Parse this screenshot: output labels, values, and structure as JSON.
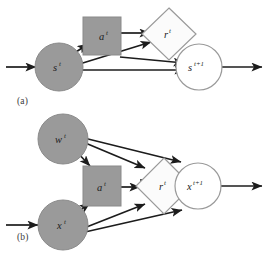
{
  "figure": {
    "background": "#ffffff",
    "colors": {
      "node_fill_gray": "#9a9a9a",
      "node_stroke_gray": "#8a8a8a",
      "node_fill_white": "#ffffff",
      "node_stroke_white": "#9a9a9a",
      "diamond_fill": "#fbfbfb",
      "diamond_stroke": "#9a9a9a",
      "arrow": "#1c1c1c",
      "label_text": "#1c1c1c",
      "panel_label_text": "#3a3a3a"
    }
  },
  "panel_a": {
    "label": "(a)",
    "nodes": [
      {
        "id": "s_t",
        "base": "s",
        "sup": "t",
        "shape": "circle",
        "fill": "gray",
        "role": "state-current"
      },
      {
        "id": "a_t",
        "base": "a",
        "sup": "t",
        "shape": "square",
        "fill": "gray",
        "role": "action"
      },
      {
        "id": "r_t",
        "base": "r",
        "sup": "t",
        "shape": "diamond",
        "fill": "white",
        "role": "reward"
      },
      {
        "id": "s_t1",
        "base": "s",
        "sup": "t+1",
        "shape": "circle",
        "fill": "white",
        "role": "state-next"
      }
    ],
    "edges": [
      {
        "from": "input",
        "to": "s_t"
      },
      {
        "from": "s_t",
        "to": "a_t"
      },
      {
        "from": "s_t",
        "to": "r_t"
      },
      {
        "from": "s_t",
        "to": "s_t1"
      },
      {
        "from": "a_t",
        "to": "r_t"
      },
      {
        "from": "a_t",
        "to": "s_t1"
      },
      {
        "from": "s_t1",
        "to": "output"
      }
    ]
  },
  "panel_b": {
    "label": "(b)",
    "nodes": [
      {
        "id": "w_t",
        "base": "w",
        "sup": "t",
        "shape": "circle",
        "fill": "gray",
        "role": "weights"
      },
      {
        "id": "x_t",
        "base": "x",
        "sup": "t",
        "shape": "circle",
        "fill": "gray",
        "role": "observation-current"
      },
      {
        "id": "a_t",
        "base": "a",
        "sup": "t",
        "shape": "square",
        "fill": "gray",
        "role": "action"
      },
      {
        "id": "r_t",
        "base": "r",
        "sup": "t",
        "shape": "diamond",
        "fill": "white",
        "role": "reward"
      },
      {
        "id": "x_t1",
        "base": "x",
        "sup": "t+1",
        "shape": "circle",
        "fill": "white",
        "role": "observation-next"
      }
    ],
    "edges": [
      {
        "from": "input",
        "to": "x_t"
      },
      {
        "from": "w_t",
        "to": "a_t"
      },
      {
        "from": "w_t",
        "to": "r_t"
      },
      {
        "from": "w_t",
        "to": "x_t1"
      },
      {
        "from": "x_t",
        "to": "a_t"
      },
      {
        "from": "x_t",
        "to": "r_t"
      },
      {
        "from": "x_t",
        "to": "x_t1"
      },
      {
        "from": "a_t",
        "to": "r_t"
      },
      {
        "from": "r_t",
        "to": "x_t1"
      },
      {
        "from": "x_t1",
        "to": "output"
      }
    ]
  }
}
